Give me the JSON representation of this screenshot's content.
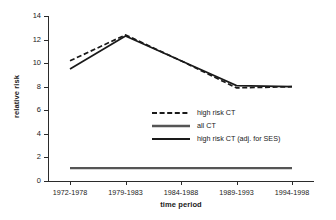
{
  "chart_data": {
    "type": "line",
    "title": "",
    "xlabel": "time period",
    "ylabel": "relative risk",
    "categories": [
      "1972-1978",
      "1979-1983",
      "1984-1988",
      "1989-1993",
      "1994-1998"
    ],
    "ylim": [
      0,
      14
    ],
    "yticks": [
      0,
      2,
      4,
      6,
      8,
      10,
      12,
      14
    ],
    "grid": false,
    "legend_position": "center-right",
    "series": [
      {
        "name": "high risk CT",
        "style": "dashed",
        "color": "#1a1a1a",
        "values": [
          10.2,
          12.4,
          10.2,
          7.9,
          8.0
        ]
      },
      {
        "name": "all CT",
        "style": "solid",
        "color": "#555555",
        "values": [
          1.1,
          1.1,
          1.1,
          1.1,
          1.1
        ]
      },
      {
        "name": "high risk CT (adj. for SES)",
        "style": "solid",
        "color": "#1a1a1a",
        "values": [
          9.5,
          12.3,
          10.2,
          8.1,
          8.0
        ]
      }
    ]
  },
  "axis": {
    "ylabel": "relative risk",
    "xlabel": "time period",
    "ytick_labels": [
      "0",
      "2",
      "4",
      "6",
      "8",
      "10",
      "12",
      "14"
    ],
    "xtick_labels": [
      "1972-1978",
      "1979-1983",
      "1984-1988",
      "1989-1993",
      "1994-1998"
    ]
  },
  "legend": {
    "items": [
      {
        "label": "high risk CT",
        "style": "dashed",
        "color": "#1a1a1a"
      },
      {
        "label": "all CT",
        "style": "solid",
        "color": "#555555"
      },
      {
        "label": "high risk CT (adj. for SES)",
        "style": "solid",
        "color": "#1a1a1a"
      }
    ]
  }
}
